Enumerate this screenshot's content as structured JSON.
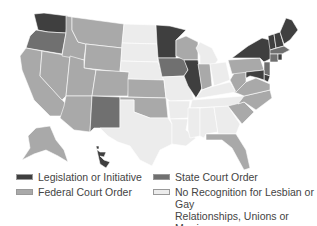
{
  "colors": {
    "legislation": "#3f3f3f",
    "state_court": "#707070",
    "federal_court": "#a9a9a9",
    "no_recognition": "#ececec"
  },
  "legend": [
    {
      "key": "legislation",
      "label": "Legislation or Initiative"
    },
    {
      "key": "state_court",
      "label": "State Court Order"
    },
    {
      "key": "federal_court",
      "label": "Federal Court Order"
    },
    {
      "key": "no_recognition",
      "label": "No Recognition for Lesbian or Gay Relationships, Unions or Marriages"
    }
  ],
  "legend_lines": {
    "no_recognition_line1": "No Recognition for Lesbian or Gay",
    "no_recognition_line2": "Relationships, Unions or Marriages"
  },
  "states": {
    "WA": "legislation",
    "OR": "state_court",
    "CA": "federal_court",
    "NV": "federal_court",
    "ID": "federal_court",
    "MT": "federal_court",
    "WY": "federal_court",
    "UT": "federal_court",
    "AZ": "federal_court",
    "CO": "federal_court",
    "NM": "state_court",
    "ND": "no_recognition",
    "SD": "no_recognition",
    "NE": "no_recognition",
    "KS": "federal_court",
    "OK": "federal_court",
    "TX": "no_recognition",
    "MN": "legislation",
    "IA": "state_court",
    "MO": "no_recognition",
    "AR": "no_recognition",
    "LA": "no_recognition",
    "WI": "federal_court",
    "IL": "legislation",
    "MI": "no_recognition",
    "IN": "federal_court",
    "OH": "no_recognition",
    "KY": "no_recognition",
    "TN": "no_recognition",
    "MS": "no_recognition",
    "AL": "no_recognition",
    "GA": "no_recognition",
    "FL": "federal_court",
    "SC": "federal_court",
    "NC": "federal_court",
    "VA": "federal_court",
    "WV": "federal_court",
    "PA": "federal_court",
    "NY": "legislation",
    "VT": "legislation",
    "NH": "legislation",
    "ME": "legislation",
    "MA": "state_court",
    "CT": "state_court",
    "RI": "legislation",
    "NJ": "state_court",
    "DE": "legislation",
    "MD": "legislation",
    "AK": "federal_court",
    "HI": "legislation"
  }
}
